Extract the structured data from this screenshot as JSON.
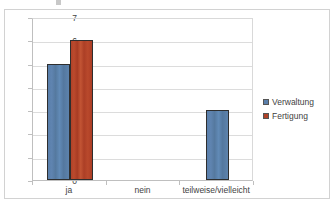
{
  "chart_data": {
    "type": "bar",
    "title": "",
    "subtitle": "",
    "xlabel": "",
    "ylabel": "",
    "categories": [
      "ja",
      "nein",
      "teilweise/vielleicht"
    ],
    "series": [
      {
        "name": "Verwaltung",
        "color": "#5a7fab",
        "values": [
          5,
          0,
          3
        ]
      },
      {
        "name": "Fertigung",
        "color": "#b04228",
        "values": [
          6,
          0,
          0
        ]
      }
    ],
    "ylim": [
      0,
      7
    ],
    "yticks": [
      0,
      1,
      2,
      3,
      4,
      5,
      6,
      7
    ],
    "ytick_labels": [
      "0",
      "1",
      "2",
      "3",
      "4",
      "5",
      "6",
      "7"
    ],
    "grid": "horizontal",
    "legend_position": "right",
    "legend": [
      {
        "label": "Verwaltung",
        "marker": "legend-swatch-icon",
        "color": "#5a7fab"
      },
      {
        "label": "Fertigung",
        "marker": "legend-swatch-icon",
        "color": "#b04228"
      }
    ],
    "annotations": []
  }
}
